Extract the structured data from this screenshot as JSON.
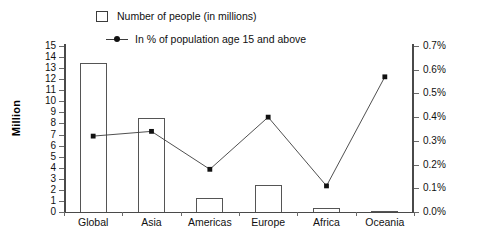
{
  "chart_data": {
    "type": "bar",
    "title": "",
    "subtitle": "",
    "xlabel": "",
    "ylabel": "Million",
    "y2label": "",
    "categories": [
      "Global",
      "Asia",
      "Americas",
      "Europe",
      "Africa",
      "Oceania"
    ],
    "ylim": [
      0,
      15
    ],
    "y2lim": [
      0,
      0.7
    ],
    "yticks": [
      "15",
      "14",
      "13",
      "12",
      "11",
      "10",
      "9",
      "8",
      "7",
      "6",
      "5",
      "4",
      "3",
      "2",
      "1",
      "0"
    ],
    "ytick_values": [
      15,
      14,
      13,
      12,
      11,
      10,
      9,
      8,
      7,
      6,
      5,
      4,
      3,
      2,
      1,
      0
    ],
    "y2ticks": [
      "0.7%",
      "0.6%",
      "0.5%",
      "0.4%",
      "0.3%",
      "0.2%",
      "0.1%",
      "0.0%"
    ],
    "y2tick_values": [
      0.7,
      0.6,
      0.5,
      0.4,
      0.3,
      0.2,
      0.1,
      0.0
    ],
    "grid": false,
    "legend_position": "top",
    "series": [
      {
        "name": "Number of people (in millions)",
        "type": "bar",
        "axis": "left",
        "values": [
          13.5,
          8.5,
          1.25,
          2.4,
          0.4,
          0.05
        ]
      },
      {
        "name": "In % of population age 15 and above",
        "type": "line",
        "axis": "right",
        "values": [
          0.32,
          0.34,
          0.18,
          0.4,
          0.11,
          0.57
        ]
      }
    ]
  },
  "legend": {
    "items": [
      {
        "label": "Number of people (in millions)",
        "marker": "bar-swatch-icon"
      },
      {
        "label": "In % of population age 15 and above",
        "marker": "line-marker-icon"
      }
    ]
  }
}
